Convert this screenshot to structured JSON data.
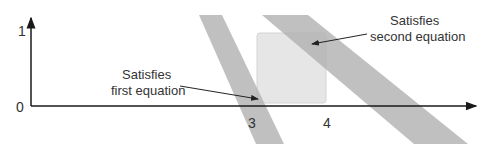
{
  "diagram": {
    "axes": {
      "y_tick_top": "1",
      "y_tick_bottom": "0",
      "x_ticks": [
        "3",
        "4"
      ]
    },
    "annotations": {
      "first": {
        "line1": "Satisfies",
        "line2": "first equation"
      },
      "second": {
        "line1": "Satisfies",
        "line2": "second equation"
      }
    },
    "colors": {
      "band": "#b8b8b8",
      "square": "#e6e6e6",
      "axis": "#1a1a1a",
      "text": "#333333"
    }
  }
}
